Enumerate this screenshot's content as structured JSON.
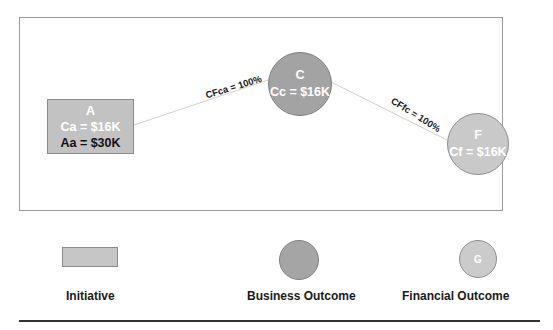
{
  "diagram": {
    "nodes": [
      {
        "id": "A",
        "type": "initiative",
        "title": "A",
        "line1": "Ca = $16K",
        "line2": "Aa = $30K"
      },
      {
        "id": "C",
        "type": "business_outcome",
        "title": "C",
        "line1": "Cc = $16K"
      },
      {
        "id": "F",
        "type": "financial_outcome",
        "title": "F",
        "line1": "Cf = $16K"
      }
    ],
    "edges": [
      {
        "from": "A",
        "to": "C",
        "label": "CFca = 100%"
      },
      {
        "from": "C",
        "to": "F",
        "label": "CFfc = 100%"
      }
    ]
  },
  "legend": {
    "items": [
      {
        "shape": "rectangle",
        "label": "Initiative",
        "glyph": ""
      },
      {
        "shape": "circle",
        "label": "Business Outcome",
        "glyph": ""
      },
      {
        "shape": "circle",
        "label": "Financial Outcome",
        "glyph": "G"
      }
    ]
  },
  "colors": {
    "initiative_fill": "#c2c2c2",
    "business_outcome_fill": "#a3a3a3",
    "financial_outcome_fill": "#c9c9c9",
    "edge": "#d0d0d0",
    "frame": "#9a9a9a"
  }
}
